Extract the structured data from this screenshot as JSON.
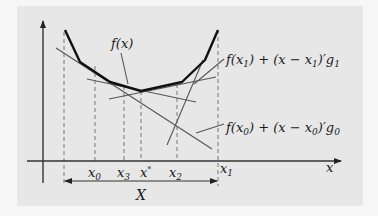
{
  "figure": {
    "background": "#e7e7e7",
    "axes": {
      "x_label": "x",
      "y_axis": "vertical arrow"
    },
    "curve_label": "f(x)",
    "tangent_labels": {
      "x1": {
        "f": "f(x",
        "sub1": "1",
        "mid": ") + (x − x",
        "sub2": "1",
        "end": ")′g",
        "sub3": "1"
      },
      "x0": {
        "f": "f(x",
        "sub1": "0",
        "mid": ") + (x − x",
        "sub2": "0",
        "end": ")′g",
        "sub3": "0"
      }
    },
    "x_ticks": [
      {
        "name": "x",
        "sub": "0"
      },
      {
        "name": "x",
        "sub": "3"
      },
      {
        "name": "x",
        "sub": "*"
      },
      {
        "name": "x",
        "sub": "2"
      },
      {
        "name": "x",
        "sub": "1"
      }
    ],
    "interval_label": "X",
    "colors": {
      "curve": "#111111",
      "tangent": "#555555",
      "dashed": "#777777",
      "axis": "#333333"
    }
  }
}
